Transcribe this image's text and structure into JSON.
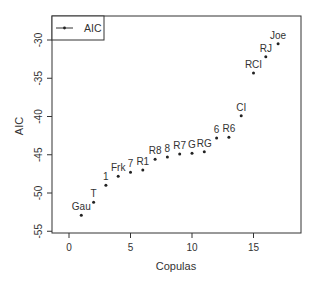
{
  "chart_data": {
    "type": "scatter",
    "title": "",
    "xlabel": "Copulas",
    "ylabel": "AIC",
    "xlim": [
      -1,
      18.5
    ],
    "ylim": [
      -55,
      -27.5
    ],
    "xticks": [
      0,
      5,
      10,
      15
    ],
    "yticks": [
      -55,
      -50,
      -45,
      -40,
      -35,
      -30
    ],
    "grid": false,
    "legend": {
      "position": "top-left",
      "entries": [
        "AIC"
      ]
    },
    "points": [
      {
        "x": 1,
        "y": -52.9,
        "label": "Gau"
      },
      {
        "x": 2,
        "y": -51.2,
        "label": "T"
      },
      {
        "x": 3,
        "y": -49.0,
        "label": "1"
      },
      {
        "x": 4,
        "y": -47.8,
        "label": "Frk"
      },
      {
        "x": 5,
        "y": -47.3,
        "label": "7"
      },
      {
        "x": 6,
        "y": -47.0,
        "label": "R1"
      },
      {
        "x": 7,
        "y": -45.6,
        "label": "R8"
      },
      {
        "x": 8,
        "y": -45.3,
        "label": "8"
      },
      {
        "x": 9,
        "y": -44.9,
        "label": "R7"
      },
      {
        "x": 10,
        "y": -44.8,
        "label": "G"
      },
      {
        "x": 11,
        "y": -44.6,
        "label": "RG"
      },
      {
        "x": 12,
        "y": -42.8,
        "label": "6"
      },
      {
        "x": 13,
        "y": -42.7,
        "label": "R6"
      },
      {
        "x": 14,
        "y": -39.9,
        "label": "CI"
      },
      {
        "x": 15,
        "y": -34.3,
        "label": "RCI"
      },
      {
        "x": 16,
        "y": -32.2,
        "label": "RJ"
      },
      {
        "x": 17,
        "y": -30.5,
        "label": "Joe"
      }
    ]
  },
  "axes": {
    "xlabel": "Copulas",
    "ylabel": "AIC"
  },
  "legend": {
    "label": "AIC"
  },
  "colors": {
    "point": "#222222",
    "axis": "#333333",
    "text": "#333333"
  }
}
